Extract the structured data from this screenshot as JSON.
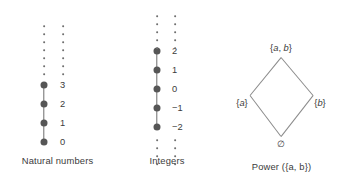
{
  "figure": {
    "background": "#ffffff",
    "node_color": "#565656",
    "line_color": "#6d6d6d",
    "text_color": "#3b3b3b"
  },
  "panels": [
    {
      "id": "naturals",
      "caption": "Natural numbers",
      "type": "chain",
      "ellipsis_above": true,
      "ellipsis_below": false,
      "labels": [
        "3",
        "2",
        "1",
        "0"
      ]
    },
    {
      "id": "integers",
      "caption": "Integers",
      "type": "chain",
      "ellipsis_above": true,
      "ellipsis_below": true,
      "labels": [
        "2",
        "1",
        "0",
        "−1",
        "−2"
      ]
    },
    {
      "id": "powerset",
      "caption": "Power ({a, b})",
      "type": "lattice",
      "nodes": {
        "top": "{a, b}",
        "left": "{a}",
        "right": "{b}",
        "bottom": "∅"
      }
    }
  ],
  "chart_data": {
    "type": "diagram",
    "title": "",
    "diagrams": [
      {
        "name": "Natural numbers",
        "kind": "hasse-chain",
        "elements": [
          "0",
          "1",
          "2",
          "3"
        ],
        "order": "0 < 1 < 2 < 3 < ...",
        "unbounded_above": true,
        "unbounded_below": false
      },
      {
        "name": "Integers",
        "kind": "hasse-chain",
        "elements": [
          "−2",
          "−1",
          "0",
          "1",
          "2"
        ],
        "order": "... < −2 < −1 < 0 < 1 < 2 < ...",
        "unbounded_above": true,
        "unbounded_below": true
      },
      {
        "name": "Power ({a, b})",
        "kind": "hasse-lattice",
        "elements": [
          "∅",
          "{a}",
          "{b}",
          "{a, b}"
        ],
        "edges": [
          [
            "∅",
            "{a}"
          ],
          [
            "∅",
            "{b}"
          ],
          [
            "{a}",
            "{a, b}"
          ],
          [
            "{b}",
            "{a, b}"
          ]
        ],
        "order": "subset inclusion"
      }
    ]
  }
}
